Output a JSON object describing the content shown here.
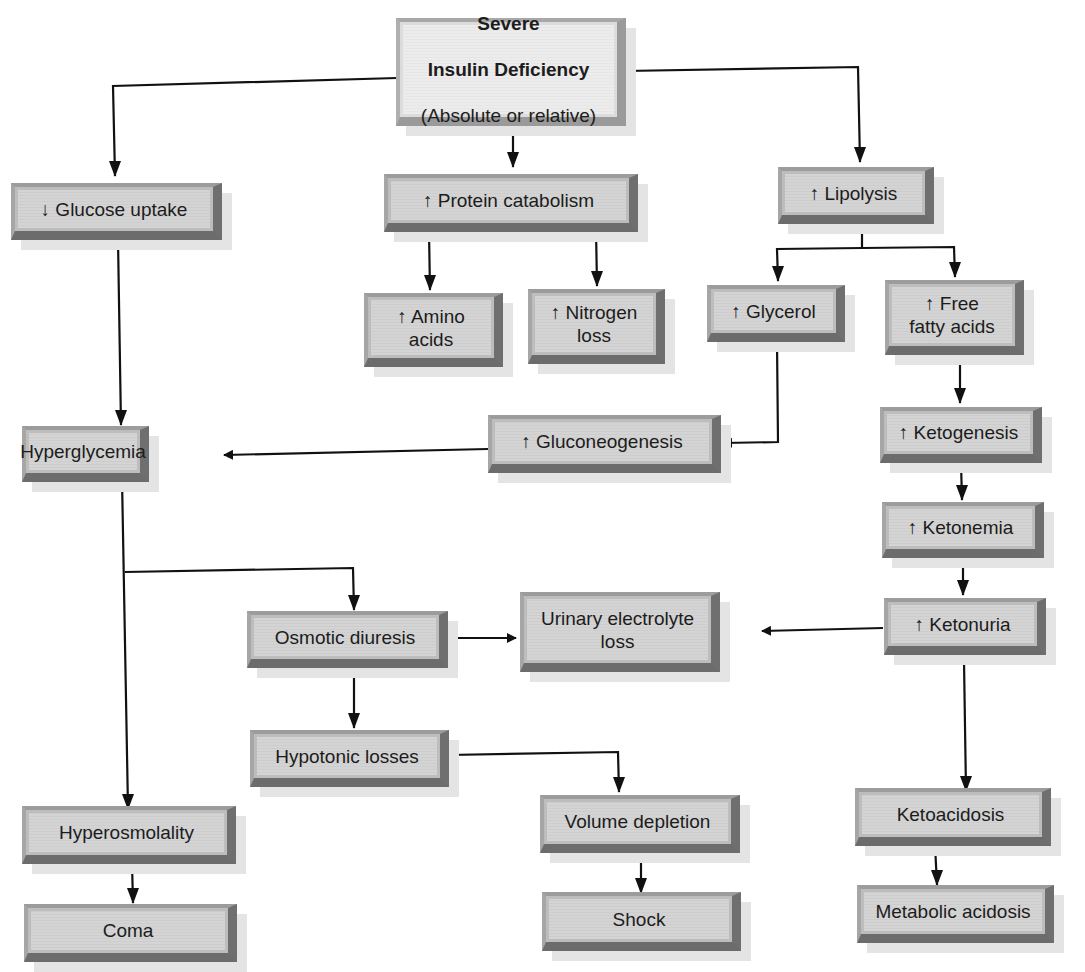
{
  "diagram": {
    "colors": {
      "box_face": "#d2d2d2",
      "box_edge": "#6f6f6f",
      "root_face": "#e8e8e8",
      "line": "#111111"
    },
    "root": {
      "title_line1": "Severe",
      "title_line2": "Insulin Deficiency",
      "subtitle": "(Absolute or relative)"
    },
    "nodes": {
      "glucose_uptake": "↓ Glucose uptake",
      "protein_catabolism": "↑ Protein catabolism",
      "lipolysis": "↑  Lipolysis",
      "amino_acids": "↑ Amino\nacids",
      "nitrogen_loss": "↑ Nitrogen\nloss",
      "glycerol": "↑ Glycerol",
      "free_fatty_acids": "↑ Free\nfatty acids",
      "hyperglycemia": "Hyperglycemia",
      "gluconeogenesis": "↑ Gluconeogenesis",
      "ketogenesis": "↑ Ketogenesis",
      "ketonemia": "↑ Ketonemia",
      "osmotic_diuresis": "Osmotic diuresis",
      "urinary_electrolyte_loss": "Urinary electrolyte\nloss",
      "ketonuria": "↑ Ketonuria",
      "hypotonic_losses": "Hypotonic losses",
      "hyperosmolality": "Hyperosmolality",
      "volume_depletion": "Volume depletion",
      "ketoacidosis": "Ketoacidosis",
      "coma": "Coma",
      "shock": "Shock",
      "metabolic_acidosis": "Metabolic acidosis"
    },
    "edges": [
      [
        "root",
        "glucose_uptake"
      ],
      [
        "root",
        "protein_catabolism"
      ],
      [
        "root",
        "lipolysis"
      ],
      [
        "protein_catabolism",
        "amino_acids"
      ],
      [
        "protein_catabolism",
        "nitrogen_loss"
      ],
      [
        "lipolysis",
        "glycerol"
      ],
      [
        "lipolysis",
        "free_fatty_acids"
      ],
      [
        "glucose_uptake",
        "hyperglycemia"
      ],
      [
        "glycerol",
        "gluconeogenesis"
      ],
      [
        "gluconeogenesis",
        "hyperglycemia"
      ],
      [
        "free_fatty_acids",
        "ketogenesis"
      ],
      [
        "ketogenesis",
        "ketonemia"
      ],
      [
        "ketonemia",
        "ketonuria"
      ],
      [
        "hyperglycemia",
        "osmotic_diuresis"
      ],
      [
        "hyperglycemia",
        "hyperosmolality"
      ],
      [
        "osmotic_diuresis",
        "urinary_electrolyte_loss"
      ],
      [
        "ketonuria",
        "urinary_electrolyte_loss"
      ],
      [
        "osmotic_diuresis",
        "hypotonic_losses"
      ],
      [
        "hypotonic_losses",
        "volume_depletion"
      ],
      [
        "ketonuria",
        "ketoacidosis"
      ],
      [
        "hyperosmolality",
        "coma"
      ],
      [
        "volume_depletion",
        "shock"
      ],
      [
        "ketoacidosis",
        "metabolic_acidosis"
      ]
    ]
  }
}
